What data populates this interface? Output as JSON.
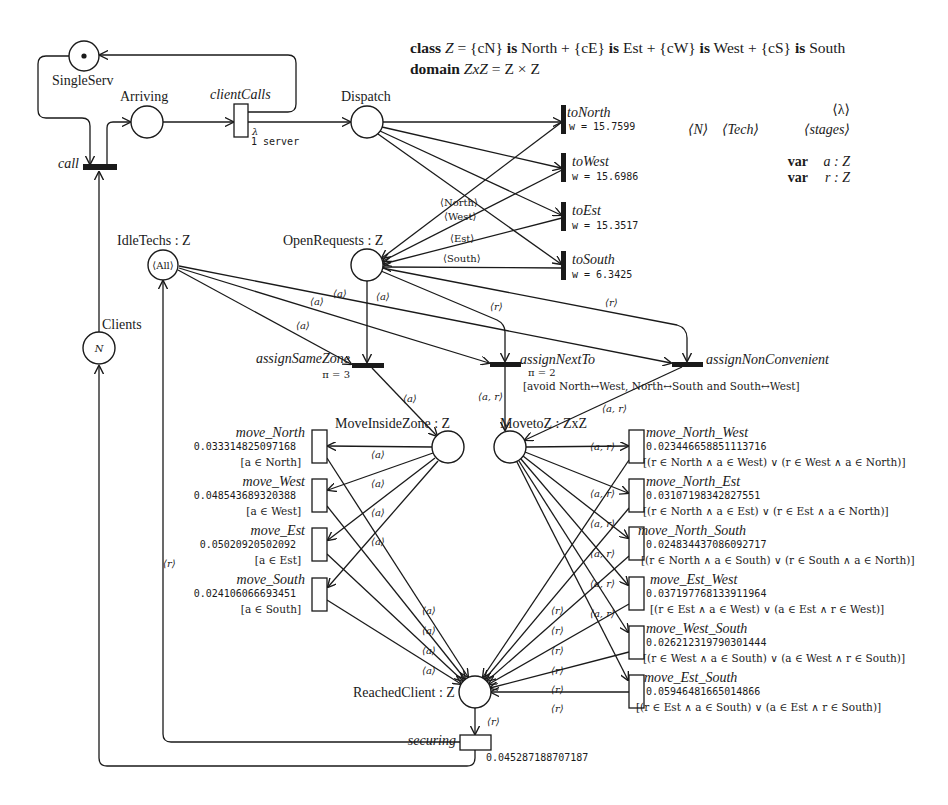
{
  "header": {
    "class_line": {
      "kw_class": "class",
      "name": "Z",
      "eq": " = {cN} ",
      "is1": "is",
      "n1": " North + {cE} ",
      "is2": "is",
      "n2": " Est + {cW} ",
      "is3": "is",
      "n3": " West + {cS} ",
      "is4": "is",
      "n4": " South"
    },
    "domain_line": {
      "kw_domain": "domain",
      "name": "ZxZ",
      "rest": " = Z × Z"
    }
  },
  "legend": {
    "lambda": "⟨λ⟩",
    "N": "⟨N⟩",
    "tech": "⟨Tech⟩",
    "stages": "⟨stages⟩",
    "var_a_kw": "var",
    "var_a": "a : Z",
    "var_r_kw": "var",
    "var_r": "r : Z"
  },
  "places": {
    "single_serv": {
      "label": "SingleServ",
      "token": "•"
    },
    "arriving": {
      "label": "Arriving"
    },
    "dispatch": {
      "label": "Dispatch"
    },
    "idle_techs": {
      "label": "IdleTechs : Z",
      "marking": "⟨All⟩"
    },
    "open_requests": {
      "label": "OpenRequests : Z"
    },
    "clients": {
      "label": "Clients",
      "marking": "N"
    },
    "move_inside_zone": {
      "label": "MoveInsideZone : Z"
    },
    "move_to_z": {
      "label": "MovetoZ : ZxZ"
    },
    "reached_client": {
      "label": "ReachedClient : Z"
    }
  },
  "transitions": {
    "call": {
      "label": "call"
    },
    "client_calls": {
      "label": "clientCalls",
      "rate": "λ",
      "servers": "1 server"
    },
    "to_north": {
      "label": "toNorth",
      "weight": "w = 15.7599"
    },
    "to_west": {
      "label": "toWest",
      "weight": "w = 15.6986"
    },
    "to_est": {
      "label": "toEst",
      "weight": "w = 15.3517"
    },
    "to_south": {
      "label": "toSouth",
      "weight": "w = 6.3425"
    },
    "assign_same_zone": {
      "label": "assignSameZone",
      "priority": "π = 3"
    },
    "assign_next_to": {
      "label": "assignNextTo",
      "priority": "π = 2",
      "guard": "[avoid North↔West, North↔South and South↔West]"
    },
    "assign_non_convenient": {
      "label": "assignNonConvenient"
    },
    "move_north": {
      "label": "move_North",
      "rate": "0.033314825097168",
      "guard": "[a ∈ North]"
    },
    "move_west": {
      "label": "move_West",
      "rate": "0.048543689320388",
      "guard": "[a ∈ West]"
    },
    "move_est": {
      "label": "move_Est",
      "rate": "0.05020920502092",
      "guard": "[a ∈ Est]"
    },
    "move_south": {
      "label": "move_South",
      "rate": "0.024106066693451",
      "guard": "[a ∈ South]"
    },
    "move_north_west": {
      "label": "move_North_West",
      "rate": "0.023446658851113716",
      "guard": "[(r ∈ North ∧ a ∈ West) ∨ (r ∈ West ∧ a ∈ North)]"
    },
    "move_north_est": {
      "label": "move_North_Est",
      "rate": "0.03107198342827551",
      "guard": "[(r ∈ North ∧ a ∈ Est) ∨ (r ∈ Est ∧ a ∈ North)]"
    },
    "move_north_south": {
      "label": "move_North_South",
      "rate": "0.024834437086092717",
      "guard": "[(r ∈ North ∧ a ∈ South) ∨ (r ∈ South ∧ a ∈ North)]"
    },
    "move_est_west": {
      "label": "move_Est_West",
      "rate": "0.037197768133911964",
      "guard": "[(r ∈ Est ∧ a ∈ West) ∨ (a ∈ Est ∧ r ∈ West)]"
    },
    "move_west_south": {
      "label": "move_West_South",
      "rate": "0.026212319790301444",
      "guard": "[(r ∈ West ∧ a ∈ South) ∨ (a ∈ West ∧ r ∈ South)]"
    },
    "move_est_south": {
      "label": "move_Est_South",
      "rate": "0.05946481665014866",
      "guard": "[(r ∈ Est ∧ a ∈ South) ∨ (a ∈ Est ∧ r ∈ South)]"
    },
    "securing": {
      "label": "securing",
      "rate": "0.045287188707187"
    }
  },
  "arc_labels": {
    "north": "⟨North⟩",
    "west": "⟨West⟩",
    "est": "⟨Est⟩",
    "south": "⟨South⟩",
    "a": "⟨a⟩",
    "r": "⟨r⟩",
    "ar": "⟨a, r⟩"
  }
}
